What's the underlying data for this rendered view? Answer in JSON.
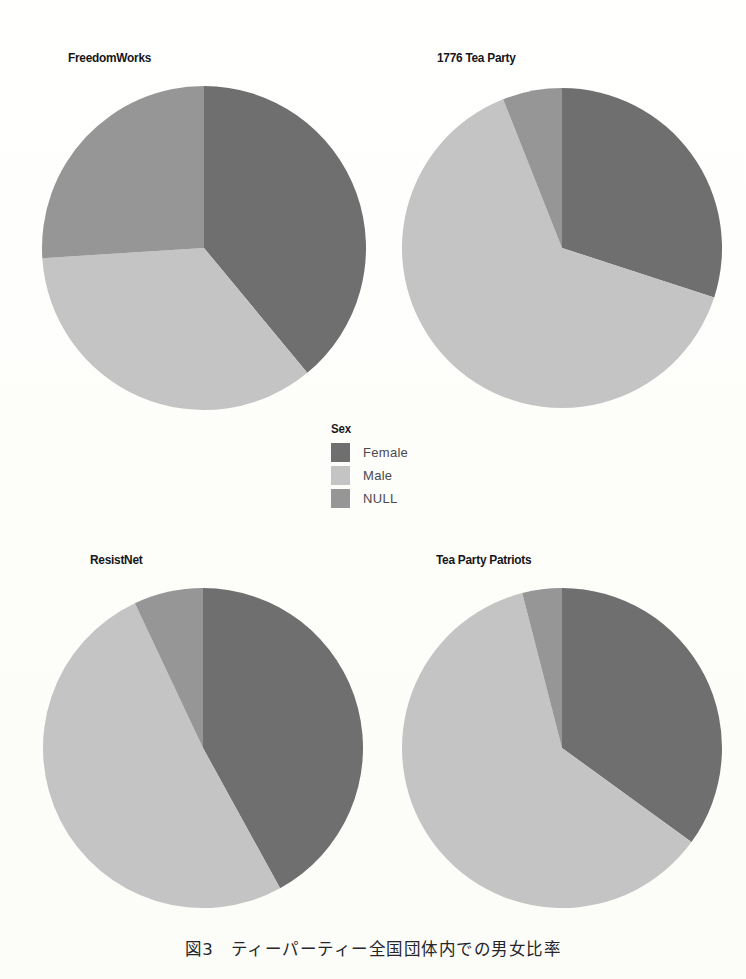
{
  "figure": {
    "caption": "図3　ティーパーティー全国団体内での男女比率",
    "background_color": "#fffffd"
  },
  "legend": {
    "title": "Sex",
    "items": [
      {
        "label": "Female",
        "color": "#6f6f6f"
      },
      {
        "label": "Male",
        "color": "#c4c4c4"
      },
      {
        "label": "NULL",
        "color": "#969696"
      }
    ]
  },
  "chart_data": [
    {
      "type": "pie",
      "title": "FreedomWorks",
      "categories": [
        "Female",
        "Male",
        "NULL"
      ],
      "values": [
        39,
        35,
        26
      ],
      "colors": [
        "#6f6f6f",
        "#c4c4c4",
        "#969696"
      ],
      "start_angle": 0,
      "direction": "clockwise",
      "legend_title": "Sex",
      "legend_position": "center"
    },
    {
      "type": "pie",
      "title": "1776 Tea Party",
      "categories": [
        "Female",
        "Male",
        "NULL"
      ],
      "values": [
        30,
        64,
        6
      ],
      "colors": [
        "#6f6f6f",
        "#c4c4c4",
        "#969696"
      ],
      "start_angle": 0,
      "direction": "clockwise",
      "legend_title": "Sex",
      "legend_position": "center"
    },
    {
      "type": "pie",
      "title": "ResistNet",
      "categories": [
        "Female",
        "Male",
        "NULL"
      ],
      "values": [
        42,
        51,
        7
      ],
      "colors": [
        "#6f6f6f",
        "#c4c4c4",
        "#969696"
      ],
      "start_angle": 0,
      "direction": "clockwise",
      "legend_title": "Sex",
      "legend_position": "center"
    },
    {
      "type": "pie",
      "title": "Tea Party Patriots",
      "categories": [
        "Female",
        "Male",
        "NULL"
      ],
      "values": [
        35,
        61,
        4
      ],
      "colors": [
        "#6f6f6f",
        "#c4c4c4",
        "#969696"
      ],
      "start_angle": 0,
      "direction": "clockwise",
      "legend_title": "Sex",
      "legend_position": "center"
    }
  ],
  "layout": {
    "charts": [
      {
        "title_x": 68,
        "title_y": 50,
        "cx": 204,
        "cy": 248,
        "r": 162
      },
      {
        "title_x": 437,
        "title_y": 50,
        "cx": 562,
        "cy": 248,
        "r": 160
      },
      {
        "title_x": 90,
        "title_y": 552,
        "cx": 203,
        "cy": 748,
        "r": 160
      },
      {
        "title_x": 436,
        "title_y": 552,
        "cx": 562,
        "cy": 748,
        "r": 160
      }
    ],
    "legend_x": 331,
    "legend_y": 422,
    "caption_y": 936
  }
}
